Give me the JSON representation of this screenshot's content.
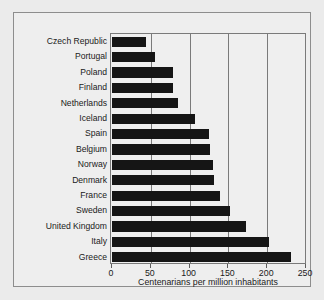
{
  "chart_data": {
    "type": "bar",
    "orientation": "horizontal",
    "title": "",
    "xlabel": "Centenarians per million inhabitants",
    "ylabel": "",
    "xlim": [
      0,
      250
    ],
    "xticks": [
      0,
      50,
      100,
      150,
      200,
      250
    ],
    "xtick_labels": [
      "0",
      "50",
      "100",
      "150",
      "200",
      "250"
    ],
    "grid": "vertical",
    "legend": "none",
    "bar_color": "#151515",
    "categories": [
      "Czech Republic",
      "Portugal",
      "Poland",
      "Finland",
      "Netherlands",
      "Iceland",
      "Spain",
      "Belgium",
      "Norway",
      "Denmark",
      "France",
      "Sweden",
      "United Kingdom",
      "Italy",
      "Greece"
    ],
    "values": [
      44,
      55,
      78,
      78,
      85,
      107,
      125,
      126,
      130,
      131,
      139,
      152,
      173,
      202,
      231
    ]
  },
  "colors": {
    "background": "#ebebeb",
    "panel": "#eeeeee",
    "frame": "#8d8d8d",
    "axis": "#7a7a7a",
    "bar": "#151515",
    "text": "#1a1a1a"
  }
}
